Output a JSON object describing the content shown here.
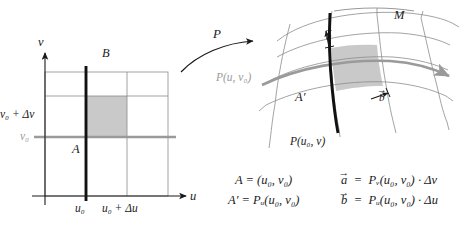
{
  "figure": {
    "width": 475,
    "height": 230,
    "background": "#ffffff"
  },
  "colors": {
    "ink": "#1a1a1a",
    "grid_line": "#8c8c8c",
    "gray_highlight": "#9a9a9a",
    "shaded_cell": "#c9c9c9",
    "thick_black": "#111111",
    "background": "#ffffff"
  },
  "left_panel": {
    "name": "parameter-plane",
    "axis_labels": {
      "horizontal": "u",
      "vertical": "v"
    },
    "x_ticks": [
      {
        "label": "u",
        "sub": "0"
      },
      {
        "label": "u",
        "sub": "0",
        "plus": "+ Δu"
      }
    ],
    "x_tick_texts": [
      "u₀",
      "u₀ + Δu"
    ],
    "y_tick_texts": [
      "v₀ + Δv",
      "v₀"
    ],
    "point_labels": [
      {
        "text": "B",
        "role": "top-of-vertical-line"
      },
      {
        "text": "A",
        "role": "corner-of-shaded-cell"
      }
    ],
    "gray_line_label": "v₀",
    "shaded_cell_note": "cell between u₀, u₀+Δu and v₀, v₀+Δv"
  },
  "map_arrow": {
    "label": "P",
    "name": "mapping-arrow"
  },
  "right_panel": {
    "name": "surface-patch",
    "surface_label": "M",
    "curve_labels": [
      {
        "text": "P(u, v₀)",
        "color": "gray",
        "name": "u-parameter-curve-label"
      },
      {
        "text": "P(u₀, v)",
        "color": "ink",
        "name": "v-parameter-curve-label"
      }
    ],
    "point_label": "A′",
    "vectors": [
      {
        "symbol": "a",
        "name": "vector-a-label"
      },
      {
        "symbol": "b",
        "name": "vector-b-label"
      }
    ]
  },
  "equations": {
    "left_column": [
      "A = (u₀, v₀)",
      "A′ = Pᵤ(u₀, v₀)"
    ],
    "right_column": [
      "a⃗ = Pᵥ(u₀, v₀) · Δv",
      "b⃗ = Pᵤ(u₀, v₀) · Δu"
    ],
    "parts": {
      "A_lhs": "A",
      "A_rhs": "(u₀, v₀)",
      "Aprime_lhs": "A′",
      "Aprime_rhs": "Pᵤ(u₀, v₀)",
      "a_lhs": "a",
      "a_rhs": "Pᵥ(u₀, v₀) · Δv",
      "b_lhs": "b",
      "b_rhs": "Pᵤ(u₀, v₀) · Δu",
      "equals": "=",
      "dot": "·",
      "arrow": "→",
      "P": "P",
      "sub_u": "u",
      "sub_v": "v",
      "delta_u": "Δu",
      "delta_v": "Δv",
      "paren_open": "(",
      "paren_close": ")",
      "comma": ",",
      "u0": "u₀",
      "v0": "v₀"
    }
  }
}
